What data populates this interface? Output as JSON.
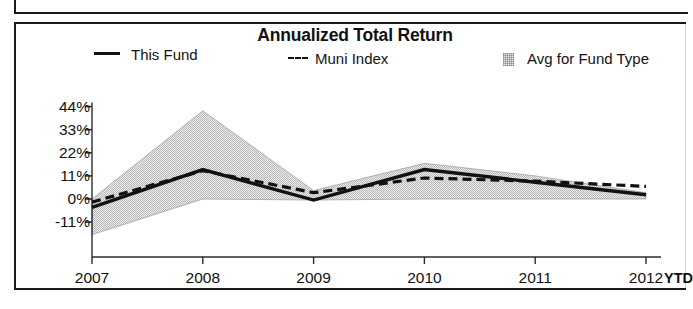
{
  "chart_data": {
    "type": "area",
    "title": "Annualized Total Return",
    "xlabel": "",
    "ylabel": "",
    "grid": false,
    "legend_position": "top",
    "categories": [
      "2007",
      "2008",
      "2009",
      "2010",
      "2011",
      "2012"
    ],
    "x_tick_labels": [
      "2007",
      "2008",
      "2009",
      "2010",
      "2011",
      "2012"
    ],
    "x_suffix_label": "YTD",
    "y_tick_labels": [
      "44%",
      "33%",
      "22%",
      "11%",
      "0%",
      "-11%"
    ],
    "y_tick_values": [
      44,
      33,
      22,
      11,
      0,
      -11
    ],
    "ylim": [
      -18,
      47
    ],
    "series": [
      {
        "name": "This Fund",
        "style": "solid",
        "color": "#111111",
        "values": [
          -4,
          14,
          -0.5,
          14,
          8,
          2
        ]
      },
      {
        "name": "Muni Index",
        "style": "dashed",
        "color": "#111111",
        "values": [
          -1.5,
          13.5,
          3,
          10,
          8.5,
          6
        ]
      },
      {
        "name": "Avg for Fund Type",
        "style": "band",
        "color": "#e6e6e6",
        "upper": [
          0,
          42,
          4,
          17,
          11,
          3
        ],
        "lower": [
          -17,
          0,
          -0.5,
          0,
          0,
          0
        ]
      }
    ]
  },
  "legend": {
    "this_fund": "This Fund",
    "muni_index": "Muni Index",
    "avg_for_fund_type": "Avg for Fund Type"
  },
  "colors": {
    "line": "#111111",
    "band_fill": "#e6e6e6",
    "frame": "#1a1a1a",
    "text": "#111111"
  }
}
